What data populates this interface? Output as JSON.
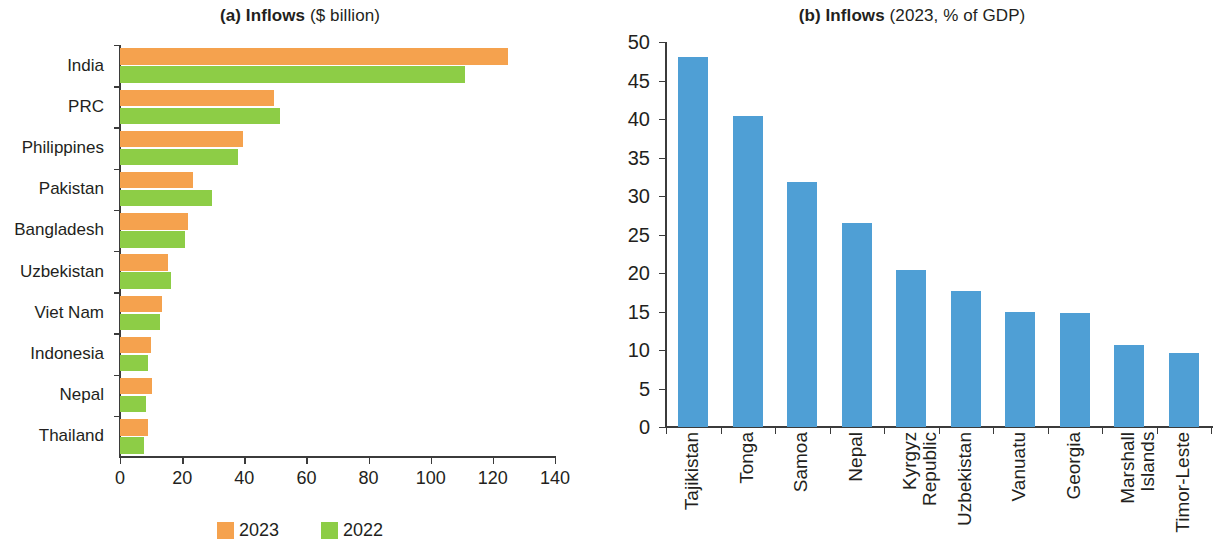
{
  "figure": {
    "panel_a": {
      "title_bold": "(a) Inflows",
      "title_light": "($ billion)"
    },
    "panel_b": {
      "title_bold": "(b) Inflows",
      "title_light": "(2023, % of GDP)"
    }
  },
  "colors": {
    "series_2023": "#F5A24E",
    "series_2022": "#8DCD46",
    "series_gdp": "#4F9FD5",
    "axis": "#3b3b3b",
    "text": "#231f20"
  },
  "legend": {
    "items": [
      {
        "label": "2023",
        "color": "#F5A24E"
      },
      {
        "label": "2022",
        "color": "#8DCD46"
      }
    ]
  },
  "chart_data": [
    {
      "type": "bar",
      "orientation": "horizontal",
      "title": "(a) Inflows ($ billion)",
      "xlabel": "",
      "ylabel": "",
      "xlim": [
        0,
        140
      ],
      "xticks": [
        0,
        20,
        40,
        60,
        80,
        100,
        120,
        140
      ],
      "xtick_labels": [
        "0",
        "20",
        "40",
        "60",
        "80",
        "100",
        "120",
        "140"
      ],
      "grid": false,
      "legend_position": "bottom-center",
      "categories": [
        "India",
        "PRC",
        "Philippines",
        "Pakistan",
        "Bangladesh",
        "Uzbekistan",
        "Viet Nam",
        "Indonesia",
        "Nepal",
        "Thailand"
      ],
      "series": [
        {
          "name": "2023",
          "color": "#F5A24E",
          "values": [
            125.0,
            49.5,
            39.5,
            23.5,
            22.0,
            15.5,
            13.5,
            10.0,
            10.3,
            9.0
          ]
        },
        {
          "name": "2022",
          "color": "#8DCD46",
          "values": [
            111.0,
            51.5,
            38.0,
            29.5,
            21.0,
            16.4,
            13.0,
            9.0,
            8.4,
            7.7
          ]
        }
      ]
    },
    {
      "type": "bar",
      "orientation": "vertical",
      "title": "(b) Inflows (2023, % of GDP)",
      "xlabel": "",
      "ylabel": "",
      "ylim": [
        0,
        50
      ],
      "yticks": [
        0,
        5,
        10,
        15,
        20,
        25,
        30,
        35,
        40,
        45,
        50
      ],
      "ytick_labels": [
        "0",
        "5",
        "10",
        "15",
        "20",
        "25",
        "30",
        "35",
        "40",
        "45",
        "50"
      ],
      "grid": false,
      "legend_position": "none",
      "categories": [
        "Tajikistan",
        "Tonga",
        "Samoa",
        "Nepal",
        "Kyrgyz\nRepublic",
        "Uzbekistan",
        "Vanuatu",
        "Georgia",
        "Marshall\nIslands",
        "Timor-Leste"
      ],
      "series": [
        {
          "name": "2023 (% of GDP)",
          "color": "#4F9FD5",
          "values": [
            48.1,
            40.4,
            31.8,
            26.5,
            20.4,
            17.7,
            15.0,
            14.8,
            10.7,
            9.6
          ]
        }
      ]
    }
  ]
}
